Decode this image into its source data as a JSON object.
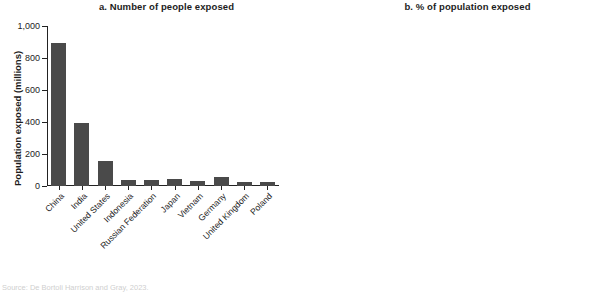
{
  "source_note": "Source: De Bortoli Harrison and Gray, 2023.",
  "chart_data": [
    {
      "type": "bar",
      "panel_label": "a",
      "title": "a. Number of people exposed",
      "xlabel": "",
      "ylabel": "Population exposed (millions)",
      "ylim": [
        0,
        1000
      ],
      "yticks": [
        0,
        200,
        400,
        600,
        800,
        1000
      ],
      "ytick_labels": [
        "0",
        "200",
        "400",
        "600",
        "800",
        "1,000"
      ],
      "grid": false,
      "legend": "none",
      "bar_color": "#4a4a4a",
      "categories": [
        "China",
        "India",
        "United States",
        "Indonesia",
        "Russian Federation",
        "Japan",
        "Vietnam",
        "Germany",
        "United Kingdom",
        "Poland"
      ],
      "values": [
        895,
        392,
        155,
        40,
        35,
        42,
        30,
        58,
        24,
        22
      ]
    },
    {
      "type": "bar",
      "panel_label": "b",
      "title": "b. % of population exposed",
      "xlabel": "",
      "ylabel": "% of population exposed",
      "ylim": [
        0,
        100
      ],
      "yticks": [
        0,
        20,
        40,
        60,
        80,
        100
      ],
      "ytick_labels": [
        "0",
        "20",
        "40",
        "60",
        "80",
        "100"
      ],
      "grid": false,
      "legend": "none",
      "bar_color": "#a9a9a9",
      "categories": [
        "Czech Republic",
        "Taiwan, China",
        "Germany",
        "Netherlands",
        "Poland",
        "Slovak Republic",
        "China",
        "United Kingdom",
        "Bosnia and Herzegovina",
        "Hungary"
      ],
      "values": [
        97,
        94,
        83,
        78,
        77,
        66,
        64.5,
        62,
        58,
        55
      ]
    }
  ]
}
